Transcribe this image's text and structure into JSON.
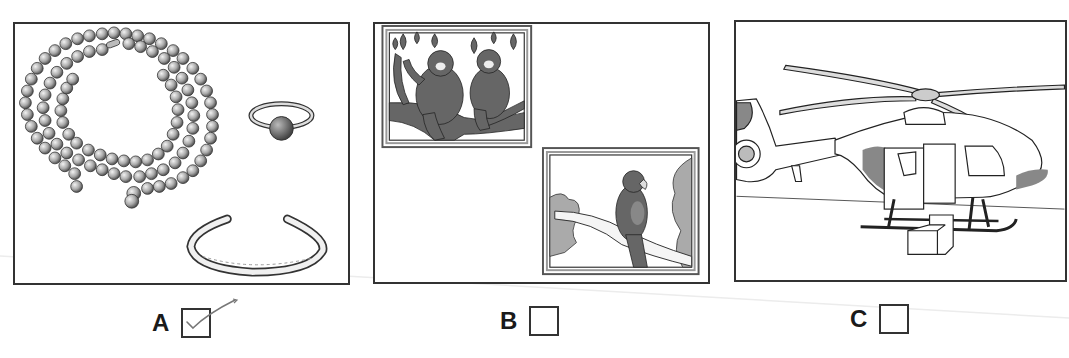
{
  "question": {
    "options": [
      {
        "letter": "A",
        "picture": "jewellery: pearl necklace, ring, bangle",
        "checked": true
      },
      {
        "letter": "B",
        "picture": "animals: two monkeys on a branch, a parrot on a branch",
        "checked": false
      },
      {
        "letter": "C",
        "picture": "helicopter with open door and steps",
        "checked": false
      }
    ]
  },
  "colors": {
    "frame": "#333333",
    "ink": "#1a1a1a",
    "fill_gray": "#8c8c8c",
    "tick": "#777777"
  }
}
